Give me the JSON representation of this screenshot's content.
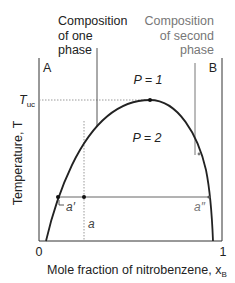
{
  "diagram": {
    "callouts": {
      "one_phase": [
        "Composition",
        "of one",
        "phase"
      ],
      "second_phase": [
        "Composition",
        "of second",
        "phase"
      ]
    },
    "corner_labels": {
      "left": "A",
      "right": "B"
    },
    "regions": {
      "one_phase": "P = 1",
      "two_phase": "P = 2"
    },
    "y_axis": {
      "label": "Temperature, T",
      "tick": "T",
      "tick_sub": "uc"
    },
    "x_axis": {
      "label": "Mole fraction of nitrobenzene, x",
      "label_sub": "B",
      "tick_min": "0",
      "tick_max": "1"
    },
    "points": {
      "a_prime": "a′",
      "a": "a",
      "a_double_prime": "a″"
    },
    "colors": {
      "line": "#222222",
      "gray_text": "#777777",
      "tie_line": "#666666",
      "dotted": "#999999"
    }
  }
}
